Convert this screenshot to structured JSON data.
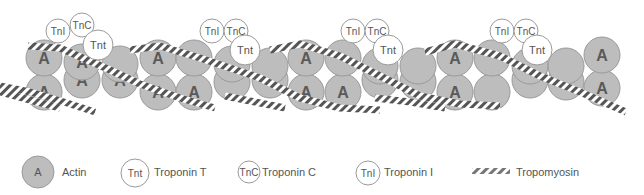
{
  "diagram": {
    "colors": {
      "actin_fill": "#bdbdbd",
      "actin_stroke": "#9a9a9a",
      "actin_letter": "#5a5a5a",
      "troponin_fill": "#ffffff",
      "troponin_stroke": "#9a9a9a",
      "text": "#555555",
      "stripe_dark": "#555555"
    },
    "actin": {
      "letter": "A",
      "top_row": [
        {
          "cx": 44,
          "cy": 58,
          "show_label": true
        },
        {
          "cx": 82,
          "cy": 62,
          "show_label": true
        },
        {
          "cx": 120,
          "cy": 64,
          "show_label": false
        },
        {
          "cx": 158,
          "cy": 58,
          "show_label": true
        },
        {
          "cx": 194,
          "cy": 58,
          "show_label": false
        },
        {
          "cx": 232,
          "cy": 64,
          "show_label": false
        },
        {
          "cx": 270,
          "cy": 66,
          "show_label": false
        },
        {
          "cx": 306,
          "cy": 58,
          "show_label": true
        },
        {
          "cx": 343,
          "cy": 58,
          "show_label": false
        },
        {
          "cx": 380,
          "cy": 66,
          "show_label": false
        },
        {
          "cx": 418,
          "cy": 66,
          "show_label": false
        },
        {
          "cx": 455,
          "cy": 58,
          "show_label": true
        },
        {
          "cx": 492,
          "cy": 58,
          "show_label": false
        },
        {
          "cx": 530,
          "cy": 66,
          "show_label": false
        },
        {
          "cx": 566,
          "cy": 66,
          "show_label": false
        },
        {
          "cx": 602,
          "cy": 55,
          "show_label": true
        }
      ],
      "bottom_row": [
        {
          "cx": 44,
          "cy": 92,
          "show_label": true
        },
        {
          "cx": 82,
          "cy": 80,
          "show_label": true
        },
        {
          "cx": 120,
          "cy": 80,
          "show_label": true
        },
        {
          "cx": 158,
          "cy": 92,
          "show_label": true
        },
        {
          "cx": 194,
          "cy": 92,
          "show_label": true
        },
        {
          "cx": 232,
          "cy": 82,
          "show_label": false
        },
        {
          "cx": 270,
          "cy": 80,
          "show_label": false
        },
        {
          "cx": 306,
          "cy": 92,
          "show_label": true
        },
        {
          "cx": 343,
          "cy": 92,
          "show_label": true
        },
        {
          "cx": 380,
          "cy": 80,
          "show_label": false
        },
        {
          "cx": 418,
          "cy": 82,
          "show_label": false
        },
        {
          "cx": 455,
          "cy": 92,
          "show_label": true
        },
        {
          "cx": 492,
          "cy": 92,
          "show_label": false
        },
        {
          "cx": 530,
          "cy": 80,
          "show_label": false
        },
        {
          "cx": 566,
          "cy": 82,
          "show_label": false
        },
        {
          "cx": 602,
          "cy": 88,
          "show_label": true
        }
      ]
    },
    "troponin_complexes": [
      {
        "tni": {
          "cx": 58,
          "cy": 31,
          "label": "TnI"
        },
        "tnc": {
          "cx": 82,
          "cy": 25,
          "label": "TnC"
        },
        "tnt": {
          "cx": 98,
          "cy": 45,
          "label": "Tnt"
        }
      },
      {
        "tni": {
          "cx": 212,
          "cy": 31,
          "label": "TnI"
        },
        "tnc": {
          "cx": 236,
          "cy": 31,
          "label": "TnC"
        },
        "tnt": {
          "cx": 245,
          "cy": 50,
          "label": "Tnt"
        }
      },
      {
        "tni": {
          "cx": 353,
          "cy": 31,
          "label": "TnI"
        },
        "tnc": {
          "cx": 377,
          "cy": 31,
          "label": "TnC"
        },
        "tnt": {
          "cx": 388,
          "cy": 50,
          "label": "Tnt"
        }
      },
      {
        "tni": {
          "cx": 502,
          "cy": 31,
          "label": "TnI"
        },
        "tnc": {
          "cx": 526,
          "cy": 31,
          "label": "TnC"
        },
        "tnt": {
          "cx": 537,
          "cy": 50,
          "label": "Tnt"
        }
      }
    ],
    "tropomyosin_strands": [
      {
        "points": "28,46 60,48 110,70 140,84 180,98 215,108"
      },
      {
        "points": "0,92 30,100 60,108"
      },
      {
        "points": "130,50 160,46 200,58 260,78 300,98 340,108 380,110"
      },
      {
        "points": "270,50 300,44 340,56 380,76 420,96 460,104 500,106"
      },
      {
        "points": "425,52 455,44 500,56 540,76 580,92 626,112"
      },
      {
        "points": "225,96 255,102 285,108"
      },
      {
        "points": "0,86 30,92 64,102 95,112"
      },
      {
        "points": "375,98 410,102 445,108"
      }
    ]
  },
  "legend": {
    "items": [
      {
        "symbol": "A",
        "label": "Actin",
        "type": "actin"
      },
      {
        "symbol": "Tnt",
        "label": "Troponin T",
        "type": "troponin"
      },
      {
        "symbol": "TnC",
        "label": "Troponin C",
        "type": "troponin"
      },
      {
        "symbol": "TnI",
        "label": "Troponin I",
        "type": "troponin"
      },
      {
        "symbol": "",
        "label": "Tropomyosin",
        "type": "tropomyosin"
      }
    ]
  }
}
